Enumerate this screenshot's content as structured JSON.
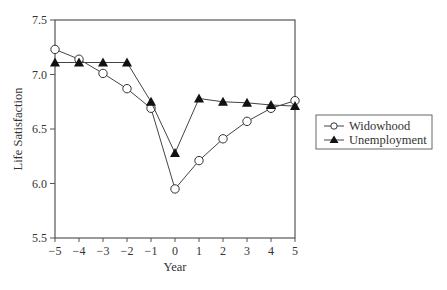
{
  "chart_data": {
    "type": "line",
    "title": "",
    "xlabel": "Year",
    "ylabel": "Life Satisfaction",
    "x": [
      -5,
      -4,
      -3,
      -2,
      -1,
      0,
      1,
      2,
      3,
      4,
      5
    ],
    "xticks": [
      "−5",
      "−4",
      "−3",
      "−2",
      "−1",
      "0",
      "1",
      "2",
      "3",
      "4",
      "5"
    ],
    "yticks": [
      "5.5",
      "6.0",
      "6.5",
      "7.0",
      "7.5"
    ],
    "ytick_values": [
      5.5,
      6.0,
      6.5,
      7.0,
      7.5
    ],
    "xlim": [
      -5,
      5
    ],
    "ylim": [
      5.5,
      7.5
    ],
    "grid": false,
    "legend_position": "right",
    "series": [
      {
        "name": "Widowhood",
        "marker": "open-circle",
        "values": [
          7.23,
          7.14,
          7.01,
          6.87,
          6.69,
          5.95,
          6.21,
          6.41,
          6.57,
          6.69,
          6.76
        ]
      },
      {
        "name": "Unemployment",
        "marker": "filled-triangle",
        "values": [
          7.11,
          7.11,
          7.11,
          7.11,
          6.75,
          6.28,
          6.78,
          6.75,
          6.74,
          6.72,
          6.71
        ]
      }
    ]
  },
  "legend": {
    "items": [
      "Widowhood",
      "Unemployment"
    ]
  },
  "colors": {
    "line": "#444444",
    "axis": "#555555",
    "text": "#333333",
    "marker_fill_open": "#ffffff",
    "marker_fill_solid": "#111111"
  }
}
